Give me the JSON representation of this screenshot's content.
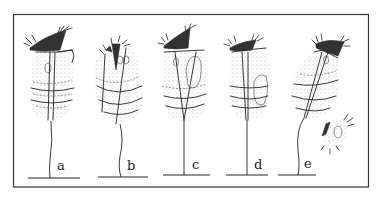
{
  "figure": {
    "panels": [
      {
        "label": "a"
      },
      {
        "label": "b"
      },
      {
        "label": "c"
      },
      {
        "label": "d"
      },
      {
        "label": "e"
      }
    ]
  },
  "colors": {
    "ink": "#222222",
    "background": "#ffffff"
  }
}
